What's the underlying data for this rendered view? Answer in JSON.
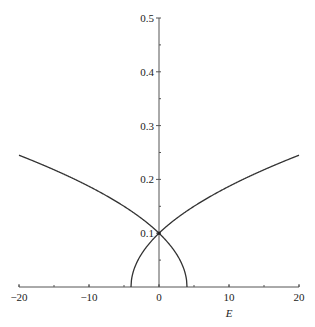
{
  "chart_data": {
    "type": "line",
    "title": "",
    "xlabel": "E",
    "ylabel": "",
    "xlim": [
      -20,
      20
    ],
    "ylim": [
      0,
      0.5
    ],
    "x_ticks": [
      -20,
      -10,
      0,
      10,
      20
    ],
    "x_tick_labels": [
      "−20",
      "−10",
      "0",
      "10",
      "20"
    ],
    "x_minor_step": 5,
    "y_ticks": [
      0.1,
      0.2,
      0.3,
      0.4,
      0.5
    ],
    "y_tick_labels": [
      "0.1",
      "0.2",
      "0.3",
      "0.4",
      "0.5"
    ],
    "y_minor_step": 0.05,
    "grid": false,
    "legend": null,
    "series": [
      {
        "name": "branch-1",
        "formula": "y = sqrt(0.01 - 0.0025*E)",
        "x": [
          -20,
          -16,
          -12,
          -8,
          -4,
          -2,
          0,
          1,
          2,
          3,
          3.5,
          3.9,
          4
        ],
        "values": [
          0.245,
          0.224,
          0.2,
          0.173,
          0.141,
          0.122,
          0.1,
          0.087,
          0.071,
          0.05,
          0.035,
          0.016,
          0
        ]
      },
      {
        "name": "branch-2",
        "formula": "y = sqrt(0.01 + 0.0025*E)",
        "x": [
          -4,
          -3.9,
          -3.5,
          -3,
          -2,
          -1,
          0,
          2,
          4,
          8,
          12,
          16,
          20
        ],
        "values": [
          0,
          0.016,
          0.035,
          0.05,
          0.071,
          0.087,
          0.1,
          0.122,
          0.141,
          0.173,
          0.2,
          0.224,
          0.245
        ]
      }
    ],
    "annotations": [
      {
        "type": "point",
        "x": 0,
        "y": 0.1,
        "label": "crossing"
      }
    ]
  }
}
